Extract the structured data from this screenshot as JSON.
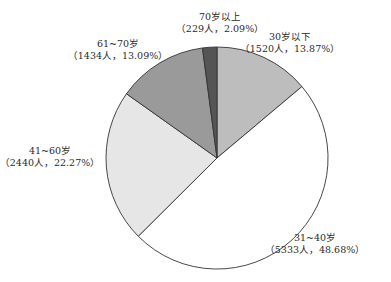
{
  "chart_data": {
    "type": "pie",
    "title": "",
    "start_angle_deg": 0,
    "direction": "clockwise",
    "center": [
      217,
      158
    ],
    "radius": 111,
    "slices": [
      {
        "name": "30岁以下",
        "count": 1520,
        "count_label": "1520人",
        "percent": 13.87,
        "percent_label": "13.87%",
        "color": "#bdbdbd"
      },
      {
        "name": "31~40岁",
        "count": 5333,
        "count_label": "5333人",
        "percent": 48.68,
        "percent_label": "48.68%",
        "color": "#ffffff"
      },
      {
        "name": "41~60岁",
        "count": 2440,
        "count_label": "2440人",
        "percent": 22.27,
        "percent_label": "22.27%",
        "color": "#e6e6e6"
      },
      {
        "name": "61~70岁",
        "count": 1434,
        "count_label": "1434人",
        "percent": 13.09,
        "percent_label": "13.09%",
        "color": "#9a9a9a"
      },
      {
        "name": "70岁以上",
        "count": 229,
        "count_label": "229人",
        "percent": 2.09,
        "percent_label": "2.09%",
        "color": "#555555"
      }
    ],
    "labels": [
      {
        "line1": "30岁以下",
        "line2": "（1520人，13.87%）",
        "x": 290,
        "y": 31
      },
      {
        "line1": "31~40岁",
        "line2": "（5333人，48.68%）",
        "x": 315,
        "y": 232
      },
      {
        "line1": "41~60岁",
        "line2": "（2440人，22.27%）",
        "x": 50,
        "y": 145
      },
      {
        "line1": "61~70岁",
        "line2": "（1434人，13.09%）",
        "x": 118,
        "y": 38
      },
      {
        "line1": "70岁以上",
        "line2": "（229人，2.09%）",
        "x": 220,
        "y": 11
      }
    ],
    "stroke_color": "#333333"
  }
}
